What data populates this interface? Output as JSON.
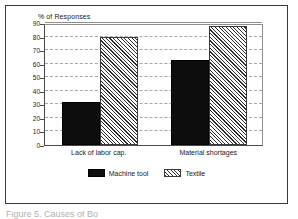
{
  "figure": {
    "caption": "Figure 5.  Causes of Bo",
    "frame_color": "#3a3a3a",
    "background": "#ffffff"
  },
  "chart_data": {
    "type": "bar",
    "title": "",
    "subtitle": "",
    "ylabel": "% of Responses",
    "xlabel": "",
    "categories": [
      "Lack of labor cap.",
      "Material shortages"
    ],
    "series": [
      {
        "name": "Machine tool",
        "values": [
          32,
          63
        ],
        "color": "#0d0d0d",
        "pattern": "solid"
      },
      {
        "name": "Textile",
        "values": [
          80,
          88
        ],
        "color": "#2b2b2b",
        "pattern": "diagonal-hatch"
      }
    ],
    "ylim": [
      0,
      90
    ],
    "yticks": [
      0,
      10,
      20,
      30,
      40,
      50,
      60,
      70,
      80,
      90
    ],
    "ytick_labels": [
      "0",
      "10",
      "20",
      "30",
      "40",
      "50",
      "60",
      "70",
      "80",
      "90"
    ],
    "grid": true,
    "grid_axis": "y",
    "legend_position": "bottom-center"
  },
  "legend": {
    "entries": [
      {
        "label": "Machine tool",
        "swatch": "solid-black-swatch"
      },
      {
        "label": "Textile",
        "swatch": "hatched-swatch"
      }
    ]
  }
}
